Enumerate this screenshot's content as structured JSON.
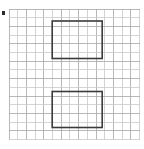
{
  "figure": {
    "type": "grid-geometry-figure",
    "width": 144,
    "height": 149,
    "background_color": "#ffffff",
    "caption": "",
    "title": "",
    "grid": {
      "name": "graph-paper-grid",
      "line_color": "#a6a6a6",
      "line_color_light": "#c9c9c9",
      "line_width": 0.8,
      "cell_size": 8.7,
      "columns": 15,
      "rows": 15,
      "left": 9,
      "top": 9,
      "right": 139.5,
      "bottom": 139.5,
      "show_grid": true
    },
    "shapes": [
      {
        "name": "upper-rectangle",
        "type": "rectangle",
        "stroke_color": "#3b3b3b",
        "stroke_width": 1.6,
        "fill": "none",
        "x": 52.2,
        "y": 21.0,
        "width": 50.0,
        "height": 37.5,
        "cells_wide": 6,
        "cells_tall": 4,
        "label": ""
      },
      {
        "name": "lower-rectangle",
        "type": "rectangle",
        "stroke_color": "#3b3b3b",
        "stroke_width": 1.6,
        "fill": "none",
        "x": 52.2,
        "y": 91.5,
        "width": 50.0,
        "height": 36.0,
        "cells_wide": 6,
        "cells_tall": 4,
        "label": ""
      }
    ],
    "marks": [
      {
        "name": "corner-tick-mark",
        "type": "dot",
        "color": "#2b2b2b",
        "x": 1.5,
        "y": 11.0,
        "width": 3.0,
        "height": 3.5
      }
    ]
  }
}
